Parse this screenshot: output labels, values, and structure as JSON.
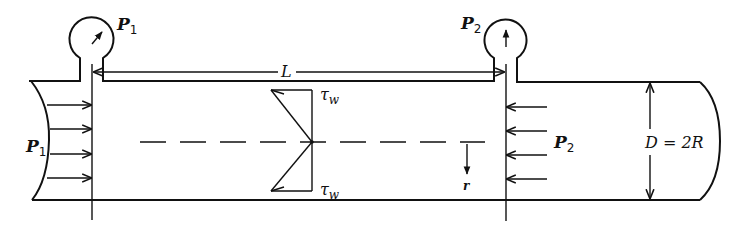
{
  "figure": {
    "labels": {
      "gauge_left": "P",
      "gauge_left_sub": "1",
      "gauge_right": "P",
      "gauge_right_sub": "2",
      "inlet_pressure": "P",
      "inlet_pressure_sub": "1",
      "outlet_pressure": "P",
      "outlet_pressure_sub": "2",
      "length": "L",
      "shear_top": "τ",
      "shear_top_sub": "w",
      "shear_bottom": "τ",
      "shear_bottom_sub": "w",
      "radial_coord": "r",
      "diameter": "D = 2R"
    },
    "elements": {
      "pipe": "horizontal pipe with curved cut ends",
      "gauges": [
        "pressure gauge at section 1",
        "pressure gauge at section 2"
      ],
      "inlet_arrows": 4,
      "outlet_arrows": 4,
      "shear_profile": "linear, zero at centerline, max τw at wall",
      "centerline": "dashed"
    },
    "colors": {
      "ink": "#111111",
      "background": "#ffffff"
    }
  }
}
